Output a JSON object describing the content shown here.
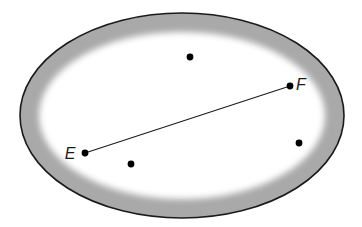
{
  "figure": {
    "kind": "geometry-diagram",
    "canvas": {
      "width": 362,
      "height": 227,
      "background": "#ffffff"
    },
    "oval": {
      "name": "outer-oval",
      "center_x": 182,
      "center_y": 115.5,
      "radius_x": 162,
      "radius_y": 102.5,
      "outline_color": "#1a1a1a",
      "outline_width": 1.6,
      "band_color": "#a9a9a9",
      "band_thickness": 19,
      "band_blur": 7,
      "interior_color": "#ffffff"
    },
    "segment": {
      "name": "segment-EF",
      "x1": 85,
      "y1": 153,
      "x2": 290,
      "y2": 86,
      "color": "#1a1a1a",
      "width": 1.1
    },
    "labeled_points": [
      {
        "id": "E",
        "label": "E",
        "x": 85,
        "y": 153,
        "radius": 3.4,
        "color": "#000000",
        "label_x": 70,
        "label_y": 159,
        "label_anchor": "middle"
      },
      {
        "id": "F",
        "label": "F",
        "x": 290,
        "y": 86,
        "radius": 3.4,
        "color": "#000000",
        "label_x": 301,
        "label_y": 90,
        "label_anchor": "middle"
      }
    ],
    "unlabeled_points": [
      {
        "id": "dot-top",
        "x": 190,
        "y": 57,
        "radius": 3.4,
        "color": "#000000"
      },
      {
        "id": "dot-lower-left",
        "x": 131,
        "y": 164,
        "radius": 3.4,
        "color": "#000000"
      },
      {
        "id": "dot-right",
        "x": 299,
        "y": 143,
        "radius": 3.4,
        "color": "#000000"
      }
    ],
    "label_font_size": 16
  }
}
